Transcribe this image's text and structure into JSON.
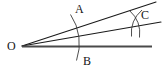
{
  "figure": {
    "kind": "angle-bisection-construction",
    "background_color": "#ffffff",
    "stroke_color": "#1a1a1a",
    "baseline_color": "#4a4a4a",
    "arc_color": "#3a3a3a",
    "labels": {
      "vertex": "O",
      "upper_point": "A",
      "lower_point": "B",
      "intersection_point": "C"
    },
    "vertex": {
      "x": 22,
      "y": 46
    },
    "rays": [
      {
        "name": "upper-ray",
        "from": {
          "x": 22,
          "y": 46
        },
        "to": {
          "x": 156,
          "y": 2
        }
      },
      {
        "name": "middle-ray",
        "from": {
          "x": 22,
          "y": 46
        },
        "to": {
          "x": 160,
          "y": 22
        }
      },
      {
        "name": "baseline-ray",
        "from": {
          "x": 22,
          "y": 46
        },
        "to": {
          "x": 152,
          "y": 46
        }
      }
    ],
    "arcs": [
      {
        "name": "arc-AB",
        "start": {
          "x": 70,
          "y": 15
        },
        "end": {
          "x": 76,
          "y": 60
        },
        "radius": 52
      },
      {
        "name": "arc-from-A",
        "start": {
          "x": 130,
          "y": 11
        },
        "end": {
          "x": 139,
          "y": 37
        },
        "radius": 30
      },
      {
        "name": "arc-from-B",
        "start": {
          "x": 132,
          "y": 36
        },
        "end": {
          "x": 141,
          "y": 10
        },
        "radius": 30
      }
    ],
    "intersection": {
      "x": 136,
      "y": 23
    }
  }
}
